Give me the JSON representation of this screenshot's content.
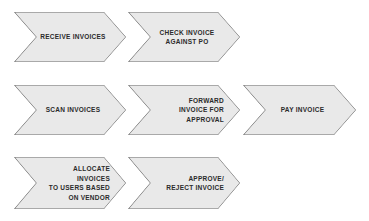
{
  "diagram": {
    "type": "process-flow",
    "title": "",
    "style": {
      "shape": "chevron",
      "fill_color": "#e9e9e9",
      "border_color": "#6b6b6b",
      "text_color": "#2b2b2b",
      "background_color": "#ffffff"
    },
    "rows": [
      {
        "id": "row-1",
        "steps": [
          {
            "id": "step-receive-invoices",
            "label": "RECEIVE INVOICES",
            "align": "center"
          },
          {
            "id": "step-check-invoice-against-po",
            "label": "CHECK INVOICE\nAGAINST PO",
            "align": "center"
          }
        ]
      },
      {
        "id": "row-2",
        "steps": [
          {
            "id": "step-scan-invoices",
            "label": "SCAN INVOICES",
            "align": "center"
          },
          {
            "id": "step-forward-invoice-for-approval",
            "label": "FORWARD\nINVOICE FOR\nAPPROVAL",
            "align": "right"
          },
          {
            "id": "step-pay-invoice",
            "label": "PAY INVOICE",
            "align": "center"
          }
        ]
      },
      {
        "id": "row-3",
        "steps": [
          {
            "id": "step-allocate-invoices-to-users-based-on-vendor",
            "label": "ALLOCATE INVOICES\nTO USERS BASED\nON VENDOR",
            "align": "right"
          },
          {
            "id": "step-approve-reject-invoice",
            "label": "APPROVE/\nREJECT INVOICE",
            "align": "right"
          }
        ]
      }
    ]
  }
}
